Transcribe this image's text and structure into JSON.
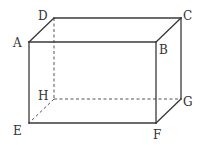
{
  "diagram": {
    "type": "rectangular-prism",
    "vertices": {
      "A": {
        "label": "A",
        "x": 29,
        "y": 42,
        "lx": 13,
        "ly": 47
      },
      "B": {
        "label": "B",
        "x": 156,
        "y": 42,
        "lx": 159,
        "ly": 54
      },
      "C": {
        "label": "C",
        "x": 181,
        "y": 18,
        "lx": 183,
        "ly": 20
      },
      "D": {
        "label": "D",
        "x": 54,
        "y": 18,
        "lx": 38,
        "ly": 20
      },
      "E": {
        "label": "E",
        "x": 29,
        "y": 123,
        "lx": 13,
        "ly": 135
      },
      "F": {
        "label": "F",
        "x": 156,
        "y": 123,
        "lx": 153,
        "ly": 139
      },
      "G": {
        "label": "G",
        "x": 181,
        "y": 99,
        "lx": 183,
        "ly": 106
      },
      "H": {
        "label": "H",
        "x": 54,
        "y": 99,
        "lx": 38,
        "ly": 100
      }
    },
    "visible_edges": [
      [
        "A",
        "B"
      ],
      [
        "B",
        "F"
      ],
      [
        "F",
        "E"
      ],
      [
        "E",
        "A"
      ],
      [
        "A",
        "D"
      ],
      [
        "D",
        "C"
      ],
      [
        "C",
        "B"
      ],
      [
        "C",
        "G"
      ],
      [
        "G",
        "F"
      ]
    ],
    "hidden_edges": [
      [
        "D",
        "H"
      ],
      [
        "H",
        "G"
      ],
      [
        "H",
        "E"
      ]
    ],
    "line_color": "#3a3a3a",
    "label_color": "#333333"
  }
}
